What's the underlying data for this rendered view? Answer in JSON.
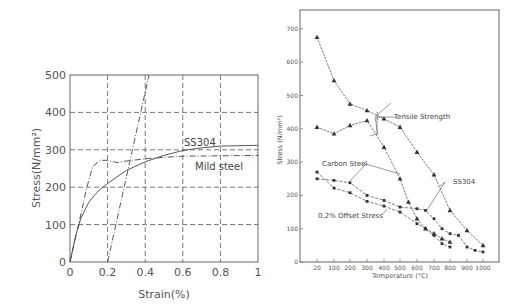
{
  "chart_data": [
    {
      "type": "line",
      "title": "",
      "xlabel": "Strain(%)",
      "ylabel": "Stress(N/mm²)",
      "xlim": [
        0,
        1
      ],
      "ylim": [
        0,
        500
      ],
      "xticks": [
        "0",
        "0.2",
        "0.4",
        "0.6",
        "0.8",
        "1"
      ],
      "yticks": [
        "0",
        "100",
        "200",
        "300",
        "400",
        "500"
      ],
      "grid": true,
      "series": [
        {
          "name": "SS304",
          "style": "solid",
          "x": [
            0,
            0.03,
            0.06,
            0.1,
            0.15,
            0.2,
            0.3,
            0.4,
            0.5,
            0.6,
            0.7,
            0.8,
            1.0
          ],
          "y": [
            0,
            70,
            120,
            160,
            190,
            210,
            245,
            268,
            285,
            298,
            305,
            310,
            312
          ]
        },
        {
          "name": "Mild steel",
          "style": "dashdot",
          "x": [
            0,
            0.05,
            0.09,
            0.12,
            0.16,
            0.2,
            0.25,
            0.3,
            0.4,
            0.5,
            0.6,
            0.8,
            1.0
          ],
          "y": [
            0,
            110,
            200,
            255,
            272,
            272,
            266,
            270,
            276,
            280,
            283,
            284,
            285
          ]
        },
        {
          "name": "0.2% offset line",
          "style": "dashdot",
          "x": [
            0.2,
            0.42
          ],
          "y": [
            0,
            500
          ]
        }
      ],
      "annotations": [
        "SS304",
        "Mild steel"
      ]
    },
    {
      "type": "line",
      "title": "",
      "xlabel": "Temperature (°C)",
      "ylabel": "Stress (N/mm²)",
      "ylim": [
        0,
        750
      ],
      "xticks": [
        "20",
        "100",
        "200",
        "300",
        "400",
        "500",
        "600",
        "700",
        "800",
        "900",
        "1000"
      ],
      "yticks": [
        "0",
        "100",
        "200",
        "300",
        "400",
        "500",
        "600",
        "700"
      ],
      "grid": false,
      "series": [
        {
          "name": "SS304 Tensile Strength",
          "marker": "triangle",
          "x": [
            20,
            100,
            200,
            300,
            400,
            500,
            600,
            700,
            800,
            900,
            1000
          ],
          "y": [
            675,
            545,
            475,
            455,
            430,
            405,
            330,
            262,
            155,
            95,
            50
          ]
        },
        {
          "name": "Carbon Steel Tensile Strength",
          "marker": "triangle",
          "x": [
            20,
            100,
            200,
            300,
            400,
            500,
            550,
            600,
            650,
            700,
            750,
            800
          ],
          "y": [
            405,
            385,
            410,
            425,
            345,
            250,
            180,
            130,
            100,
            85,
            70,
            60
          ]
        },
        {
          "name": "SS304 0.2% Offset Stress",
          "marker": "square",
          "x": [
            20,
            100,
            200,
            300,
            400,
            500,
            600,
            650,
            700,
            750,
            800,
            850,
            900,
            950,
            1000
          ],
          "y": [
            250,
            245,
            238,
            200,
            185,
            165,
            160,
            155,
            130,
            100,
            85,
            80,
            45,
            35,
            30
          ]
        },
        {
          "name": "Carbon Steel 0.2% Offset Stress",
          "marker": "square",
          "x": [
            20,
            100,
            200,
            300,
            400,
            500,
            600,
            650,
            700,
            750,
            800
          ],
          "y": [
            270,
            222,
            208,
            182,
            168,
            150,
            115,
            100,
            80,
            55,
            45
          ]
        }
      ],
      "annotations": [
        "Tensile Strength",
        "Carbon Steel",
        "SS304",
        "0.2% Offset Stress"
      ]
    }
  ]
}
